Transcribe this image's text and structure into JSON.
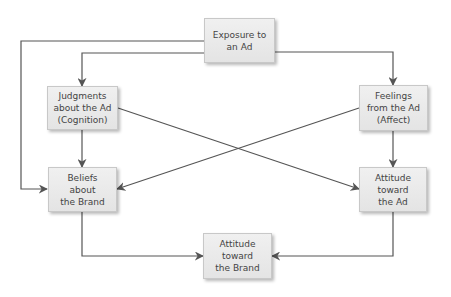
{
  "diagram": {
    "type": "flowchart",
    "colors": {
      "node_fill": "#e9e9e9",
      "node_border": "#c8c8c8",
      "edge": "#555555",
      "text": "#444444"
    },
    "nodes": [
      {
        "id": "exposure",
        "label": "Exposure to\nan Ad"
      },
      {
        "id": "judgments",
        "label": "Judgments\nabout the Ad\n(Cognition)"
      },
      {
        "id": "feelings",
        "label": "Feelings\nfrom the Ad\n(Affect)"
      },
      {
        "id": "beliefs",
        "label": "Beliefs\nabout\nthe Brand"
      },
      {
        "id": "attitude_ad",
        "label": "Attitude\ntoward\nthe Ad"
      },
      {
        "id": "attitude_brand",
        "label": "Attitude\ntoward\nthe Brand"
      }
    ],
    "edges": [
      {
        "from": "exposure",
        "to": "judgments"
      },
      {
        "from": "exposure",
        "to": "beliefs"
      },
      {
        "from": "exposure",
        "to": "feelings"
      },
      {
        "from": "judgments",
        "to": "beliefs"
      },
      {
        "from": "judgments",
        "to": "attitude_ad"
      },
      {
        "from": "feelings",
        "to": "beliefs"
      },
      {
        "from": "feelings",
        "to": "attitude_ad"
      },
      {
        "from": "beliefs",
        "to": "attitude_brand"
      },
      {
        "from": "attitude_ad",
        "to": "attitude_brand"
      }
    ]
  }
}
